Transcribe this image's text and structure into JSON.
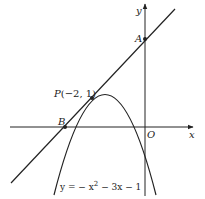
{
  "diagram": {
    "type": "coordinate-graph",
    "axes": {
      "x_label": "x",
      "y_label": "y",
      "origin_label": "O"
    },
    "curve": {
      "equation_label": "y = − x² − 3x − 1",
      "equation_prefix": "y = − x",
      "equation_exp": "2",
      "equation_suffix": " − 3x − 1",
      "coefficients": {
        "a": -1,
        "b": -3,
        "c": -1
      }
    },
    "tangent_line": {
      "equation": "y = x + 3",
      "slope": 1,
      "intercept": 3
    },
    "points": [
      {
        "name": "P",
        "label": "P(−2, 1)",
        "x": -2,
        "y": 1
      },
      {
        "name": "A",
        "label": "A",
        "x": 0,
        "y": 3
      },
      {
        "name": "B",
        "label": "B",
        "x": -3,
        "y": 0
      }
    ],
    "colors": {
      "stroke": "#222222",
      "background": "#ffffff"
    }
  }
}
